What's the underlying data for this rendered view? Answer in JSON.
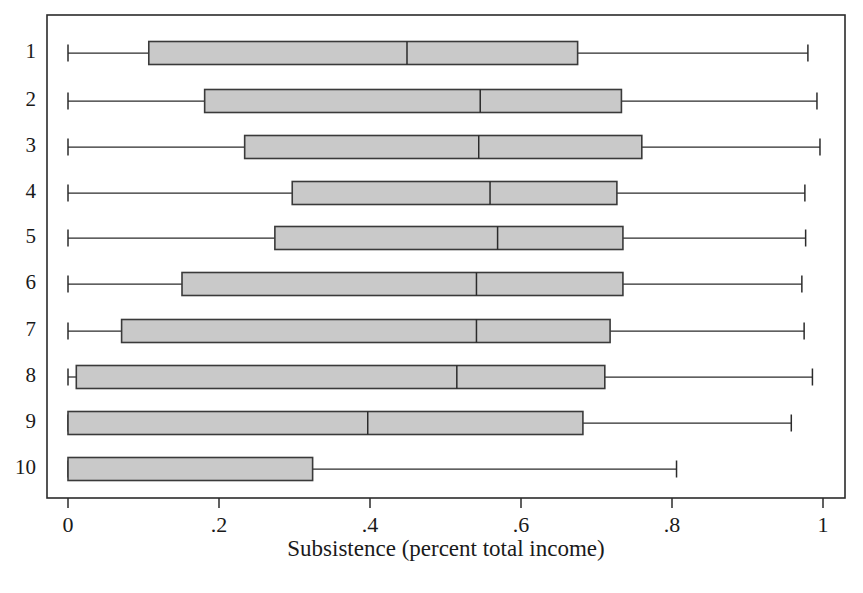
{
  "chart_data": {
    "type": "box",
    "title": "",
    "subtitle": "",
    "xlabel": "Subsistence (percent total income)",
    "ylabel": "",
    "xlim": [
      0,
      1
    ],
    "xticks": [
      0,
      0.2,
      0.4,
      0.6,
      0.8,
      1
    ],
    "xticklabels": [
      "0",
      ".2",
      ".4",
      ".6",
      ".8",
      "1"
    ],
    "yticklabels": [
      "1",
      "2",
      "3",
      "4",
      "5",
      "6",
      "7",
      "8",
      "9",
      "10"
    ],
    "grid": false,
    "legend": null,
    "orientation": "horizontal",
    "boxes": [
      {
        "label": "1",
        "whisker_low": 0.0,
        "q1": 0.107,
        "median": 0.449,
        "q3": 0.675,
        "whisker_high": 0.98
      },
      {
        "label": "2",
        "whisker_low": 0.0,
        "q1": 0.181,
        "median": 0.546,
        "q3": 0.733,
        "whisker_high": 0.992
      },
      {
        "label": "3",
        "whisker_low": 0.0,
        "q1": 0.234,
        "median": 0.544,
        "q3": 0.76,
        "whisker_high": 0.996
      },
      {
        "label": "4",
        "whisker_low": 0.0,
        "q1": 0.297,
        "median": 0.559,
        "q3": 0.727,
        "whisker_high": 0.976
      },
      {
        "label": "5",
        "whisker_low": 0.0,
        "q1": 0.274,
        "median": 0.569,
        "q3": 0.735,
        "whisker_high": 0.977
      },
      {
        "label": "6",
        "whisker_low": 0.0,
        "q1": 0.151,
        "median": 0.541,
        "q3": 0.735,
        "whisker_high": 0.972
      },
      {
        "label": "7",
        "whisker_low": 0.0,
        "q1": 0.071,
        "median": 0.541,
        "q3": 0.718,
        "whisker_high": 0.975
      },
      {
        "label": "8",
        "whisker_low": 0.0,
        "q1": 0.011,
        "median": 0.515,
        "q3": 0.711,
        "whisker_high": 0.986
      },
      {
        "label": "9",
        "whisker_low": 0.0,
        "q1": 0.0,
        "median": 0.397,
        "q3": 0.682,
        "whisker_high": 0.958
      },
      {
        "label": "10",
        "whisker_low": 0.0,
        "q1": 0.0,
        "median": null,
        "q3": 0.324,
        "whisker_high": 0.806
      }
    ],
    "colors": {
      "box_fill": "#c9c9c9",
      "box_stroke": "#3a3a3a",
      "line": "#2b2b2b",
      "background": "#ffffff"
    }
  },
  "figure": {
    "plot_area": {
      "left": 47,
      "right": 845,
      "top": 15,
      "bottom": 498
    },
    "x_axis_pixel_scale": {
      "value_0_px": 68,
      "value_1_px": 823
    },
    "row_centers_px": [
      53,
      101,
      147,
      193,
      238,
      284,
      331,
      377,
      423,
      469
    ],
    "box_height_px": 23
  }
}
